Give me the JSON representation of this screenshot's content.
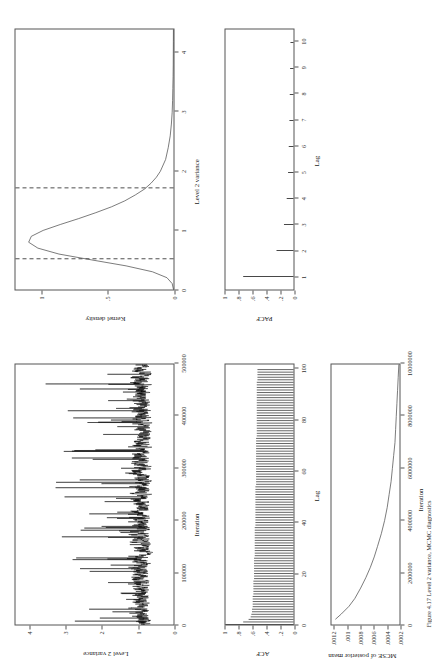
{
  "figure": {
    "layout": "2x2 grid of MCMC diagnostic plots, page rotated 90 degrees",
    "caption": "Figure 4.17 Level 2 variance, MCMC diagnostics"
  },
  "panels": {
    "trace": {
      "name": "trace-plot",
      "ylabel": "Level 2 variance",
      "xlabel": "Iteration",
      "yticks": [
        "0",
        "1",
        "2",
        "3",
        "4"
      ],
      "ytickvals": [
        0,
        1,
        2,
        3,
        4
      ],
      "xticks": [
        "0",
        "100000",
        "200000",
        "300000",
        "400000",
        "500000"
      ],
      "xtickvals": [
        0,
        100000,
        200000,
        300000,
        400000,
        500000
      ]
    },
    "density": {
      "name": "kernel-density-plot",
      "ylabel": "Kernel density",
      "xlabel": "Level 2 variance",
      "yticks": [
        "0",
        ".5",
        "1"
      ],
      "ytickvals": [
        0,
        0.5,
        1
      ],
      "xticks": [
        "0",
        "1",
        "2",
        "3",
        "4"
      ],
      "xtickvals": [
        0,
        1,
        2,
        3,
        4
      ],
      "interval_lines": [
        0.52,
        1.72
      ]
    },
    "acf": {
      "name": "acf-plot",
      "ylabel": "ACF",
      "xlabel": "Lag",
      "yticks": [
        "0",
        ".2",
        ".4",
        ".6",
        ".8",
        "1"
      ],
      "ytickvals": [
        0,
        0.2,
        0.4,
        0.6,
        0.8,
        1
      ],
      "xticks": [
        "0",
        "20",
        "40",
        "60",
        "80",
        "100"
      ],
      "xtickvals": [
        0,
        20,
        40,
        60,
        80,
        100
      ]
    },
    "pacf": {
      "name": "pacf-plot",
      "ylabel": "PACF",
      "xlabel": "Lag",
      "yticks": [
        "0",
        ".2",
        ".4",
        ".6",
        ".8",
        "1"
      ],
      "ytickvals": [
        0,
        0.2,
        0.4,
        0.6,
        0.8,
        1
      ],
      "xticks": [
        "1",
        "2",
        "3",
        "4",
        "5",
        "6",
        "7",
        "8",
        "9",
        "10"
      ],
      "xtickvals": [
        1,
        2,
        3,
        4,
        5,
        6,
        7,
        8,
        9,
        10
      ]
    },
    "mcse": {
      "name": "mcse-plot",
      "ylabel": "MCSE of posterior mean",
      "xlabel": "Iteration",
      "yticks": [
        ".0002",
        ".0004",
        ".0006",
        ".0008",
        ".001",
        ".0012"
      ],
      "ytickvals": [
        0.0002,
        0.0004,
        0.0006,
        0.0008,
        0.001,
        0.0012
      ],
      "xticks": [
        "0",
        "2000000",
        "4000000",
        "6000000",
        "8000000",
        "10000000"
      ],
      "xtickvals": [
        0,
        2000000,
        4000000,
        6000000,
        8000000,
        10000000
      ]
    }
  },
  "chart_data": [
    {
      "type": "line",
      "name": "trace",
      "title": "",
      "xlabel": "Iteration",
      "ylabel": "Level 2 variance",
      "xlim": [
        0,
        500000
      ],
      "ylim": [
        0,
        4.4
      ],
      "grid": false,
      "legend": "none",
      "description": "Dense MCMC trace of Level 2 variance; bulk between 0.4 and 2.0 with spikes to 3.5-4.2"
    },
    {
      "type": "line",
      "name": "kernel_density",
      "title": "",
      "xlabel": "Level 2 variance",
      "ylabel": "Kernel density",
      "xlim": [
        0,
        4.4
      ],
      "ylim": [
        0,
        1.2
      ],
      "grid": false,
      "legend": "none",
      "x": [
        0.0,
        0.1,
        0.2,
        0.3,
        0.4,
        0.5,
        0.6,
        0.7,
        0.8,
        0.9,
        1.0,
        1.1,
        1.2,
        1.3,
        1.4,
        1.5,
        1.6,
        1.7,
        1.8,
        1.9,
        2.0,
        2.2,
        2.4,
        2.6,
        2.8,
        3.0,
        3.2,
        3.4,
        3.6,
        3.8,
        4.0,
        4.2,
        4.4
      ],
      "y": [
        0.0,
        0.01,
        0.05,
        0.16,
        0.36,
        0.62,
        0.87,
        1.03,
        1.1,
        1.08,
        0.99,
        0.86,
        0.72,
        0.59,
        0.47,
        0.37,
        0.29,
        0.22,
        0.17,
        0.13,
        0.1,
        0.06,
        0.04,
        0.025,
        0.016,
        0.01,
        0.007,
        0.005,
        0.003,
        0.002,
        0.0015,
        0.001,
        0.0005
      ],
      "annotations": [
        {
          "type": "vline",
          "x": 0.52,
          "style": "dashed"
        },
        {
          "type": "vline",
          "x": 1.72,
          "style": "dashed"
        }
      ]
    },
    {
      "type": "bar",
      "name": "acf",
      "title": "",
      "xlabel": "Lag",
      "ylabel": "ACF",
      "xlim": [
        0,
        102
      ],
      "ylim": [
        0,
        1
      ],
      "grid": false,
      "legend": "none",
      "categories": [
        0,
        1,
        2,
        3,
        4,
        5,
        6,
        7,
        8,
        9,
        10,
        11,
        12,
        13,
        14,
        15,
        16,
        17,
        18,
        19,
        20,
        21,
        22,
        23,
        24,
        25,
        26,
        27,
        28,
        29,
        30,
        31,
        32,
        33,
        34,
        35,
        36,
        37,
        38,
        39,
        40,
        41,
        42,
        43,
        44,
        45,
        46,
        47,
        48,
        49,
        50,
        51,
        52,
        53,
        54,
        55,
        56,
        57,
        58,
        59,
        60,
        61,
        62,
        63,
        64,
        65,
        66,
        67,
        68,
        69,
        70,
        71,
        72,
        73,
        74,
        75,
        76,
        77,
        78,
        79,
        80,
        81,
        82,
        83,
        84,
        85,
        86,
        87,
        88,
        89,
        90,
        91,
        92,
        93,
        94,
        95,
        96,
        97,
        98,
        99,
        100
      ],
      "values": [
        1.0,
        0.74,
        0.66,
        0.63,
        0.62,
        0.61,
        0.61,
        0.6,
        0.6,
        0.6,
        0.6,
        0.6,
        0.59,
        0.59,
        0.59,
        0.59,
        0.59,
        0.59,
        0.58,
        0.58,
        0.58,
        0.58,
        0.58,
        0.58,
        0.58,
        0.58,
        0.58,
        0.57,
        0.57,
        0.57,
        0.57,
        0.57,
        0.57,
        0.57,
        0.57,
        0.57,
        0.57,
        0.57,
        0.57,
        0.56,
        0.56,
        0.56,
        0.56,
        0.56,
        0.56,
        0.56,
        0.56,
        0.56,
        0.56,
        0.56,
        0.56,
        0.56,
        0.56,
        0.56,
        0.56,
        0.55,
        0.55,
        0.55,
        0.55,
        0.55,
        0.55,
        0.55,
        0.55,
        0.55,
        0.55,
        0.55,
        0.55,
        0.55,
        0.55,
        0.55,
        0.55,
        0.55,
        0.55,
        0.55,
        0.54,
        0.54,
        0.54,
        0.54,
        0.54,
        0.54,
        0.54,
        0.54,
        0.54,
        0.54,
        0.54,
        0.54,
        0.54,
        0.54,
        0.54,
        0.54,
        0.54,
        0.54,
        0.54,
        0.54,
        0.54,
        0.54,
        0.53,
        0.53,
        0.53,
        0.53,
        0.53
      ]
    },
    {
      "type": "bar",
      "name": "pacf",
      "title": "",
      "xlabel": "Lag",
      "ylabel": "PACF",
      "xlim": [
        0.5,
        10.5
      ],
      "ylim": [
        0,
        1
      ],
      "grid": false,
      "legend": "none",
      "categories": [
        1,
        2,
        3,
        4,
        5,
        6,
        7,
        8,
        9,
        10
      ],
      "values": [
        0.74,
        0.25,
        0.14,
        0.1,
        0.08,
        0.07,
        0.06,
        0.055,
        0.05,
        0.045
      ]
    },
    {
      "type": "line",
      "name": "mcse",
      "title": "",
      "xlabel": "Iteration",
      "ylabel": "MCSE of posterior mean",
      "xlim": [
        0,
        10000000
      ],
      "ylim": [
        0.0002,
        0.00125
      ],
      "grid": false,
      "legend": "none",
      "x": [
        200000,
        400000,
        700000,
        1000000,
        1400000,
        1800000,
        2200000,
        2600000,
        3000000,
        3500000,
        4000000,
        4500000,
        5000000,
        5500000,
        6000000,
        6500000,
        7000000,
        7500000,
        8000000,
        8500000,
        9000000,
        9500000,
        10000000
      ],
      "y": [
        0.00119,
        0.0011,
        0.00098,
        0.00089,
        0.0008,
        0.00072,
        0.00065,
        0.00059,
        0.00054,
        0.00048,
        0.00043,
        0.00039,
        0.00036,
        0.00033,
        0.00031,
        0.00029,
        0.00027,
        0.00026,
        0.00025,
        0.00024,
        0.00023,
        0.00022,
        0.00021
      ]
    }
  ]
}
